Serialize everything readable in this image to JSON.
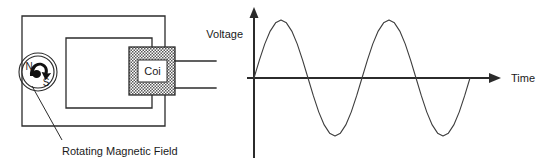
{
  "figure": {
    "width": 548,
    "height": 167,
    "background": "#ffffff",
    "line_color": "#2b2b2b",
    "wave_color": "#3d3d3d",
    "text_color": "#1a1a1a"
  },
  "generator": {
    "caption": "Rotating Magnetic Field",
    "magnet": {
      "north_pole_label": "N",
      "south_pole_label": "S",
      "rotation_arrow": "curved-rotation-arrow"
    },
    "coil": {
      "label": "Coi",
      "core_fill": "cross-hatch",
      "lead_count": 2
    },
    "frame": {
      "outer_rectangle": true,
      "inner_rectangle": true
    }
  },
  "waveform": {
    "y_axis_label": "Voltage",
    "x_axis_label": "Time",
    "y_axis_arrow": "up-arrow",
    "x_axis_arrow": "right-arrow"
  },
  "chart_data": {
    "type": "line",
    "title": "",
    "xlabel": "Time",
    "ylabel": "Voltage",
    "grid": false,
    "legend_position": "none",
    "axis_origin": {
      "x": 0,
      "y": 0
    },
    "xlim": [
      0,
      4.6
    ],
    "ylim": [
      -1.15,
      1.15
    ],
    "x_tick_labels": [],
    "y_tick_labels": [],
    "series": [
      {
        "name": "Induced Voltage",
        "function": "sine",
        "amplitude": 1.0,
        "periods": 2.0,
        "phase": 0,
        "zero_crossings": [
          0.0,
          1.0,
          2.0,
          3.0,
          4.0
        ],
        "peaks": [
          {
            "x": 0.5,
            "y": 1.0
          },
          {
            "x": 2.5,
            "y": 1.0
          }
        ],
        "troughs": [
          {
            "x": 1.5,
            "y": -1.0
          },
          {
            "x": 3.5,
            "y": -1.0
          }
        ],
        "x": [
          0.0,
          0.1,
          0.2,
          0.3,
          0.4,
          0.5,
          0.6,
          0.7,
          0.8,
          0.9,
          1.0,
          1.1,
          1.2,
          1.3,
          1.4,
          1.5,
          1.6,
          1.7,
          1.8,
          1.9,
          2.0,
          2.1,
          2.2,
          2.3,
          2.4,
          2.5,
          2.6,
          2.7,
          2.8,
          2.9,
          3.0,
          3.1,
          3.2,
          3.3,
          3.4,
          3.5,
          3.6,
          3.7,
          3.8,
          3.9,
          4.0
        ],
        "y": [
          0.0,
          0.309,
          0.588,
          0.809,
          0.951,
          1.0,
          0.951,
          0.809,
          0.588,
          0.309,
          0.0,
          -0.309,
          -0.588,
          -0.809,
          -0.951,
          -1.0,
          -0.951,
          -0.809,
          -0.588,
          -0.309,
          0.0,
          0.309,
          0.588,
          0.809,
          0.951,
          1.0,
          0.951,
          0.809,
          0.588,
          0.309,
          0.0,
          -0.309,
          -0.588,
          -0.809,
          -0.951,
          -1.0,
          -0.951,
          -0.809,
          -0.588,
          -0.309,
          0.0
        ]
      }
    ]
  }
}
